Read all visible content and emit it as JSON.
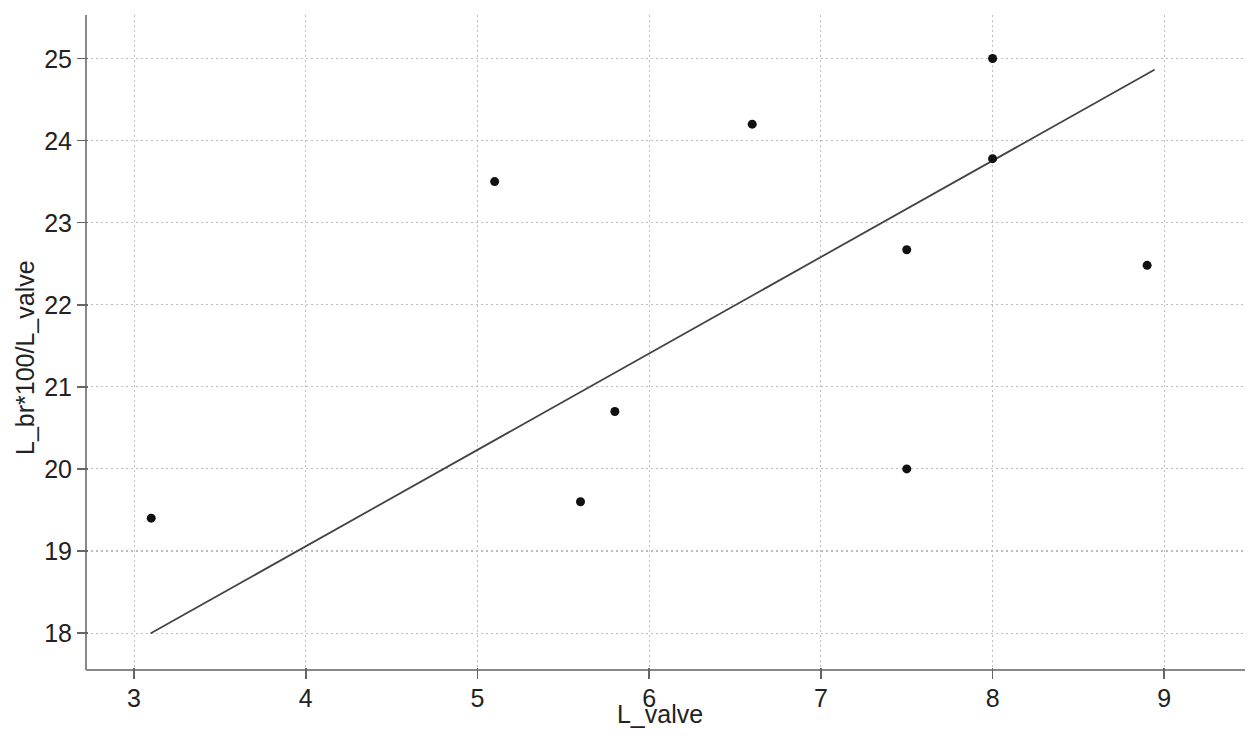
{
  "chart_data": {
    "type": "scatter",
    "title": "",
    "subtitle": "",
    "xlabel": "L_valve",
    "ylabel": "L_br*100/L_valve",
    "xlim": [
      2.72,
      9.47
    ],
    "ylim": [
      17.55,
      25.53
    ],
    "xticks": [
      3,
      4,
      5,
      6,
      7,
      8,
      9
    ],
    "yticks": [
      18,
      19,
      20,
      21,
      22,
      23,
      24,
      25
    ],
    "xtick_labels": [
      "3",
      "4",
      "5",
      "6",
      "7",
      "8",
      "9"
    ],
    "ytick_labels": [
      "18",
      "19",
      "20",
      "21",
      "22",
      "23",
      "24",
      "25"
    ],
    "grid": true,
    "grid_style": "dotted",
    "grid_color": "#bdbdbd",
    "legend": null,
    "legend_position": "none",
    "marker_color": "#111111",
    "marker_size": 9,
    "marker_shape": "circle",
    "line_color": "#444444",
    "axis_color": "#888888",
    "background_color": "#ffffff",
    "series": [
      {
        "name": "observations",
        "type": "scatter",
        "x": [
          3.1,
          5.1,
          5.6,
          5.8,
          6.6,
          7.5,
          7.5,
          8.0,
          8.0,
          8.9
        ],
        "y": [
          19.4,
          23.5,
          19.6,
          20.7,
          24.2,
          20.0,
          22.67,
          23.78,
          25.0,
          22.48
        ]
      },
      {
        "name": "trend-line",
        "type": "line",
        "x": [
          3.1,
          8.94
        ],
        "y": [
          18.0,
          24.86
        ]
      }
    ]
  },
  "axes": {
    "x_title": "L_valve",
    "y_title": "L_br*100/L_valve"
  }
}
